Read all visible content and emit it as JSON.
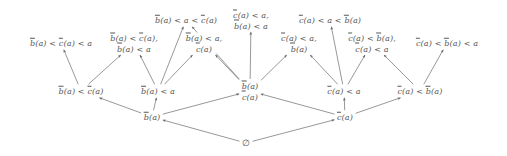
{
  "figure": {
    "type": "hasse-diagram",
    "stroke_color": "#6b6b6b",
    "text_color": "#575757",
    "background": "#ffffff",
    "width": 507,
    "height": 156
  },
  "nodes": [
    {
      "id": "n0",
      "lines": [
        "∅"
      ],
      "x": 246,
      "y": 143,
      "rank": 0
    },
    {
      "id": "n1",
      "lines": [
        "b̄(a)"
      ],
      "x": 152,
      "y": 117,
      "rank": 1
    },
    {
      "id": "n2",
      "lines": [
        "c̄(a)"
      ],
      "x": 345,
      "y": 117,
      "rank": 1
    },
    {
      "id": "n3",
      "lines": [
        "b̄(a) < c̄(a)"
      ],
      "x": 81,
      "y": 91,
      "rank": 2
    },
    {
      "id": "n4",
      "lines": [
        "b̄(a) < a"
      ],
      "x": 158,
      "y": 91,
      "rank": 2
    },
    {
      "id": "n5",
      "lines": [
        "b̄(a)",
        "c̄(a)"
      ],
      "x": 250,
      "y": 91,
      "rank": 2
    },
    {
      "id": "n6",
      "lines": [
        "c̄(a) < a"
      ],
      "x": 344,
      "y": 91,
      "rank": 2
    },
    {
      "id": "n7",
      "lines": [
        "c̄(a) < b̄(a)"
      ],
      "x": 420,
      "y": 91,
      "rank": 2
    },
    {
      "id": "n8",
      "lines": [
        "b̄(a) < c̄(a) < a"
      ],
      "x": 61,
      "y": 43,
      "rank": 3
    },
    {
      "id": "n9",
      "lines": [
        "b̄(a) < c̄(a),",
        "b̄(a) < a"
      ],
      "x": 134,
      "y": 43,
      "rank": 3
    },
    {
      "id": "n10",
      "lines": [
        "b̄(a) < a < c̄(a)"
      ],
      "x": 186,
      "y": 20,
      "rank": 3
    },
    {
      "id": "n11",
      "lines": [
        "b̄(a) < a,",
        "c̄(a)"
      ],
      "x": 204,
      "y": 43,
      "rank": 3
    },
    {
      "id": "n12",
      "lines": [
        "c̄(a) < a,",
        "b̄(a) < a"
      ],
      "x": 251,
      "y": 20,
      "rank": 3
    },
    {
      "id": "n13",
      "lines": [
        "c̄(a) < a,",
        "b̄(a)"
      ],
      "x": 299,
      "y": 43,
      "rank": 3
    },
    {
      "id": "n14",
      "lines": [
        "c̄(a) < a < b̄(a)"
      ],
      "x": 330,
      "y": 20,
      "rank": 3
    },
    {
      "id": "n15",
      "lines": [
        "c̄(a) < b̄(a),",
        "c̄(a) < a"
      ],
      "x": 372,
      "y": 43,
      "rank": 3
    },
    {
      "id": "n16",
      "lines": [
        "c̄(a) < b̄(a) < a"
      ],
      "x": 447,
      "y": 43,
      "rank": 3
    }
  ],
  "edges": [
    {
      "from": "n0",
      "to": "n1"
    },
    {
      "from": "n0",
      "to": "n2"
    },
    {
      "from": "n1",
      "to": "n3"
    },
    {
      "from": "n1",
      "to": "n4"
    },
    {
      "from": "n1",
      "to": "n5"
    },
    {
      "from": "n2",
      "to": "n5"
    },
    {
      "from": "n2",
      "to": "n6"
    },
    {
      "from": "n2",
      "to": "n7"
    },
    {
      "from": "n3",
      "to": "n8"
    },
    {
      "from": "n3",
      "to": "n9"
    },
    {
      "from": "n4",
      "to": "n9"
    },
    {
      "from": "n4",
      "to": "n10"
    },
    {
      "from": "n4",
      "to": "n11"
    },
    {
      "from": "n5",
      "to": "n10"
    },
    {
      "from": "n5",
      "to": "n11"
    },
    {
      "from": "n5",
      "to": "n12"
    },
    {
      "from": "n5",
      "to": "n13"
    },
    {
      "from": "n6",
      "to": "n13"
    },
    {
      "from": "n6",
      "to": "n14"
    },
    {
      "from": "n6",
      "to": "n15"
    },
    {
      "from": "n7",
      "to": "n15"
    },
    {
      "from": "n7",
      "to": "n16"
    }
  ]
}
